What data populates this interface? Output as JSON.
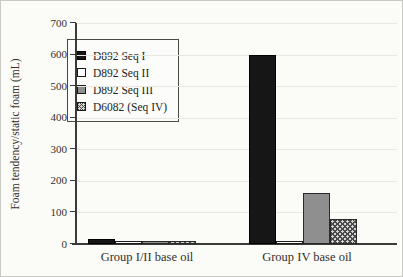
{
  "figure": {
    "background_color": "#fbfbf8",
    "border_color": "#c9c9c6",
    "ink_color": "#33302c"
  },
  "chart_data": {
    "type": "bar",
    "title": "",
    "xlabel": "",
    "ylabel": "Foam tendency/static foam (mL)",
    "ylim": [
      0,
      700
    ],
    "yticks": [
      0,
      100,
      200,
      300,
      400,
      500,
      600,
      700
    ],
    "grid": "horizontal-faint",
    "legend_position": "upper-left",
    "categories": [
      "Group I/II base oil",
      "Group IV base oil"
    ],
    "series": [
      {
        "name": "D892 Seq I",
        "style": "solid-black",
        "values": [
          15,
          600
        ]
      },
      {
        "name": "D892 Seq II",
        "style": "white-outlined",
        "values": [
          10,
          10
        ]
      },
      {
        "name": "D892 Seq III",
        "style": "solid-gray",
        "values": [
          10,
          160
        ]
      },
      {
        "name": "D6082 (Seq IV)",
        "style": "crosshatch",
        "values": [
          10,
          80
        ]
      }
    ],
    "style_colors": {
      "solid_black": "#161616",
      "white_outlined": "#ffffff",
      "solid_gray": "#8f8f8f",
      "crosshatch_fg": "#4a4a4a",
      "crosshatch_bg": "#d4d4d2",
      "outline": "#1a1a1a"
    }
  },
  "layout_px": {
    "plot_left": 75,
    "plot_top": 22,
    "plot_bottom": 243,
    "plot_right": 396,
    "bar_width": 27,
    "group_bar_left": [
      87,
      248
    ],
    "category_label_centers": [
      146,
      306
    ],
    "category_label_top": 249,
    "y_title_x": 14,
    "y_title_y": 133
  }
}
